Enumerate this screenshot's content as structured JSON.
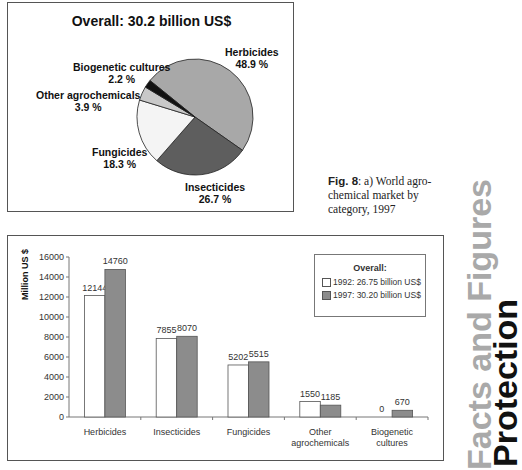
{
  "pie_chart": {
    "title": "Overall: 30.2 billion US$",
    "slices": [
      {
        "label": "Herbicides",
        "value_text": "48.9 %",
        "color": "#a8a8a8"
      },
      {
        "label": "Insecticides",
        "value_text": "26.7 %",
        "color": "#5e5e5e"
      },
      {
        "label": "Fungicides",
        "value_text": "18.3 %",
        "color": "#f4f4f4"
      },
      {
        "label": "Other agrochemicals",
        "value_text": "3.9 %",
        "color": "#c8c8c8"
      },
      {
        "label": "Biogenetic cultures",
        "value_text": "2.2 %",
        "color": "#111111"
      }
    ]
  },
  "caption": {
    "fig_label": "Fig. 8",
    "text": ": a) World agro-chemical market by category, 1997"
  },
  "bar_chart": {
    "ylabel": "Million US $",
    "legend": {
      "title": "Overall:",
      "items": [
        {
          "label": "1992: 26.75 billion US$",
          "color": "#ffffff"
        },
        {
          "label": "1997: 30.20 billion US$",
          "color": "#8c8c8c"
        }
      ]
    }
  },
  "side_title": {
    "line1": "Protection",
    "line2": "Facts and Figures"
  },
  "chart_data": [
    {
      "type": "pie",
      "title": "Overall: 30.2 billion US$",
      "categories": [
        "Herbicides",
        "Insecticides",
        "Fungicides",
        "Other agrochemicals",
        "Biogenetic cultures"
      ],
      "values": [
        48.9,
        26.7,
        18.3,
        3.9,
        2.2
      ],
      "unit": "%"
    },
    {
      "type": "bar",
      "title": "",
      "xlabel": "",
      "ylabel": "Million US $",
      "ylim": [
        0,
        16000
      ],
      "yticks": [
        0,
        2000,
        4000,
        6000,
        8000,
        10000,
        12000,
        14000,
        16000
      ],
      "categories": [
        "Herbicides",
        "Insecticides",
        "Fungicides",
        "Other agrochemicals",
        "Biogenetic cultures"
      ],
      "series": [
        {
          "name": "1992: 26.75 billion US$",
          "values": [
            12144,
            7855,
            5202,
            1550,
            0
          ],
          "color": "#ffffff"
        },
        {
          "name": "1997: 30.20 billion US$",
          "values": [
            14760,
            8070,
            5515,
            1185,
            670
          ],
          "color": "#8c8c8c"
        }
      ],
      "legend_title": "Overall:",
      "legend_position": "upper right",
      "grid": false
    }
  ]
}
